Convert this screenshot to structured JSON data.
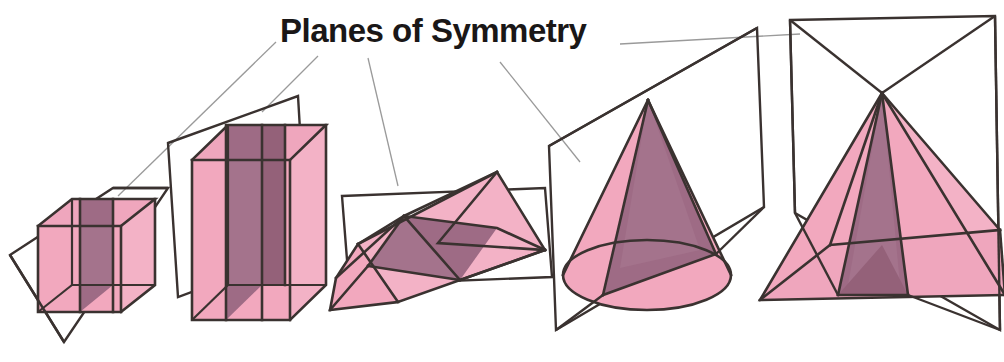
{
  "figure": {
    "title": "Planes of Symmetry",
    "background_color": "#ffffff",
    "colors": {
      "face_light": "#f2a8be",
      "face_light_alt": "#f0afc4",
      "face_dark": "#9e6b85",
      "face_dark_alt": "#a97c92",
      "outline": "#3a3230",
      "leader_line": "#8a8a8a",
      "title_color": "#1a1717",
      "plane_edge": "#3a3230"
    },
    "shapes": [
      {
        "name": "cube",
        "label": "cube",
        "plane_description": "vertical plane of symmetry through cube, parallel to left and right faces"
      },
      {
        "name": "cuboid",
        "label": "cuboid",
        "plane_description": "vertical plane of symmetry through tall cuboid"
      },
      {
        "name": "triangular-prism",
        "label": "triangular prism",
        "plane_description": "horizontal plane of symmetry through tilted triangular prism"
      },
      {
        "name": "cone",
        "label": "cone",
        "plane_description": "vertical plane of symmetry through apex and base diameter of cone"
      },
      {
        "name": "square-pyramid",
        "label": "square-based pyramid",
        "plane_description": "vertical plane of symmetry through apex of square-based pyramid"
      }
    ],
    "leader_lines": [
      {
        "name": "leader-to-cube-plane",
        "from": "title left",
        "to": "cube plane"
      },
      {
        "name": "leader-to-cuboid-plane",
        "from": "title lower-left",
        "to": "cuboid plane"
      },
      {
        "name": "leader-to-prism-plane",
        "from": "title lower-middle",
        "to": "prism plane"
      },
      {
        "name": "leader-to-cone-plane",
        "from": "title lower-right",
        "to": "cone plane"
      },
      {
        "name": "leader-to-pyramid-plane",
        "from": "title right",
        "to": "pyramid plane"
      }
    ]
  }
}
